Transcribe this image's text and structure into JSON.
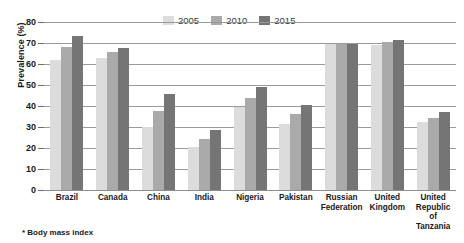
{
  "chart_data": {
    "type": "bar",
    "title": "",
    "xlabel": "",
    "ylabel": "Prevalence (%)",
    "ylim": [
      0,
      80
    ],
    "yticks": [
      0,
      10,
      20,
      30,
      40,
      50,
      60,
      70,
      80
    ],
    "grid": true,
    "legend_position": "top-center",
    "categories": [
      "Brazil",
      "Canada",
      "China",
      "India",
      "Nigeria",
      "Pakistan",
      "Russian Federation",
      "United Kingdom",
      "United Republic of Tanzania"
    ],
    "series": [
      {
        "name": "2005",
        "color": "#dcdcdc",
        "values": [
          62,
          63,
          30,
          20.5,
          39.5,
          31.5,
          69.5,
          69,
          32.5
        ]
      },
      {
        "name": "2010",
        "color": "#aaaaaa",
        "values": [
          68,
          65.5,
          37.5,
          24.5,
          44,
          36,
          69.5,
          70.5,
          34.5
        ]
      },
      {
        "name": "2015",
        "color": "#757575",
        "values": [
          73.5,
          67.5,
          45.5,
          28.5,
          49,
          40.5,
          69.5,
          71.5,
          37
        ]
      }
    ],
    "footnote": "* Body mass index"
  },
  "axis": {
    "y_title": "Prevalence (%)",
    "tick_labels": [
      "80",
      "70",
      "60",
      "50",
      "40",
      "30",
      "20",
      "10",
      "0"
    ]
  },
  "xlabels": [
    {
      "line1": "Brazil",
      "line2": "",
      "line3": ""
    },
    {
      "line1": "Canada",
      "line2": "",
      "line3": ""
    },
    {
      "line1": "China",
      "line2": "",
      "line3": ""
    },
    {
      "line1": "India",
      "line2": "",
      "line3": ""
    },
    {
      "line1": "Nigeria",
      "line2": "",
      "line3": ""
    },
    {
      "line1": "Pakistan",
      "line2": "",
      "line3": ""
    },
    {
      "line1": "Russian",
      "line2": "Federation",
      "line3": ""
    },
    {
      "line1": "United",
      "line2": "Kingdom",
      "line3": ""
    },
    {
      "line1": "United",
      "line2": "Republic",
      "line3": "of Tanzania"
    }
  ],
  "legend": {
    "items": [
      {
        "label": "2005"
      },
      {
        "label": "2010"
      },
      {
        "label": "2015"
      }
    ]
  },
  "footnote": {
    "text": "* Body mass index"
  }
}
